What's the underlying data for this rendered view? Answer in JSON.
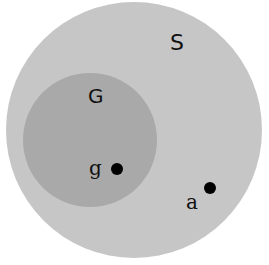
{
  "diagram": {
    "sets": [
      {
        "id": "S",
        "label": "S",
        "color": "#c6c6c6"
      },
      {
        "id": "G",
        "label": "G",
        "color": "#a9a9a9"
      }
    ],
    "points": [
      {
        "id": "g",
        "label": "g"
      },
      {
        "id": "a",
        "label": "a"
      }
    ]
  }
}
